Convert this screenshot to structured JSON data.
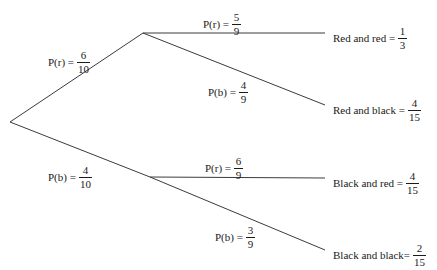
{
  "diagram": {
    "type": "probability-tree",
    "line_color": "#3b3b3b",
    "text_color": "#1a1a1a",
    "background": "#ffffff"
  },
  "branches": {
    "root_red": {
      "lead": "P(r) =",
      "num": "6",
      "den": "10"
    },
    "root_black": {
      "lead": "P(b) =",
      "num": "4",
      "den": "10"
    },
    "red_red": {
      "lead": "P(r) =",
      "num": "5",
      "den": "9"
    },
    "red_black": {
      "lead": "P(b) =",
      "num": "4",
      "den": "9"
    },
    "black_red": {
      "lead": "P(r) =",
      "num": "6",
      "den": "9"
    },
    "black_black": {
      "lead": "P(b) =",
      "num": "3",
      "den": "9"
    }
  },
  "outcomes": {
    "red_and_red": {
      "lead": "Red and red =",
      "num": "1",
      "den": "3"
    },
    "red_and_black": {
      "lead": "Red and black =",
      "num": "4",
      "den": "15"
    },
    "black_and_red": {
      "lead": "Black and red =",
      "num": "4",
      "den": "15"
    },
    "black_and_black": {
      "lead": "Black and black=",
      "num": "2",
      "den": "15"
    }
  },
  "nodes": {
    "root": {
      "x": 10,
      "y": 122
    },
    "red": {
      "x": 143,
      "y": 33
    },
    "black": {
      "x": 150,
      "y": 177
    },
    "red_red_end": {
      "x": 325,
      "y": 33
    },
    "red_black_end": {
      "x": 325,
      "y": 105
    },
    "black_red_end": {
      "x": 325,
      "y": 178
    },
    "black_black_end": {
      "x": 325,
      "y": 250
    }
  }
}
